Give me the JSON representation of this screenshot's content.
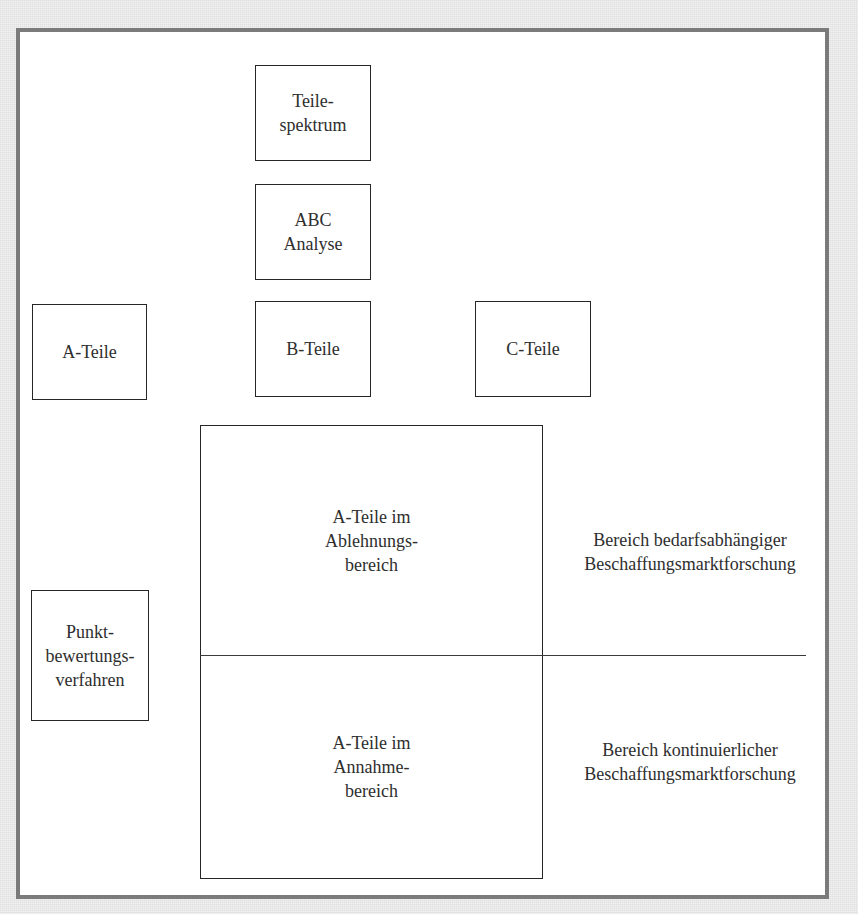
{
  "diagram": {
    "type": "flow-diagram",
    "language": "de",
    "nodes": {
      "teilespektrum": {
        "lines": [
          "Teile-",
          "spektrum"
        ]
      },
      "abc_analyse": {
        "lines": [
          "ABC",
          "Analyse"
        ]
      },
      "a_teile": {
        "lines": [
          "A-Teile"
        ]
      },
      "b_teile": {
        "lines": [
          "B-Teile"
        ]
      },
      "c_teile": {
        "lines": [
          "C-Teile"
        ]
      },
      "punktbewertung": {
        "lines": [
          "Punkt-",
          "bewertungs-",
          "verfahren"
        ]
      },
      "ablehnung": {
        "lines": [
          "A-Teile im",
          "Ablehnungs-",
          "bereich"
        ]
      },
      "annahme": {
        "lines": [
          "A-Teile im",
          "Annahme-",
          "bereich"
        ]
      }
    },
    "side_labels": {
      "bedarfsabhaengig": {
        "lines": [
          "Bereich bedarfsabhängiger",
          "Beschaffungsmarktforschung"
        ]
      },
      "kontinuierlich": {
        "lines": [
          "Bereich kontinuierlicher",
          "Beschaffungsmarktforschung"
        ]
      }
    },
    "colors": {
      "background": "#e8e8e8",
      "frame_border": "#7b7b7b",
      "box_border": "#262626",
      "text": "#2e2e2e"
    }
  }
}
